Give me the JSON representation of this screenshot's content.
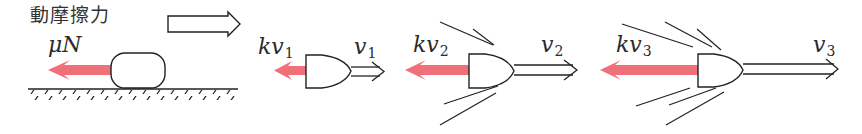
{
  "diagram": {
    "colors": {
      "force_arrow": "#f0707a",
      "stroke": "#222222",
      "background": "#ffffff"
    },
    "panels": [
      {
        "id": "kinetic-friction",
        "title": "動摩擦力",
        "force_label": "μN",
        "object": "block-on-ground",
        "motion_arrow": "hollow-arrow-right"
      },
      {
        "id": "drag-v1",
        "force_label": {
          "base": "kv",
          "sub": "1"
        },
        "velocity_label": {
          "base": "v",
          "sub": "1"
        },
        "object": "bullet",
        "streaks": 0
      },
      {
        "id": "drag-v2",
        "force_label": {
          "base": "kv",
          "sub": "2"
        },
        "velocity_label": {
          "base": "v",
          "sub": "2"
        },
        "object": "bullet",
        "streaks": 4
      },
      {
        "id": "drag-v3",
        "force_label": {
          "base": "kv",
          "sub": "3"
        },
        "velocity_label": {
          "base": "v",
          "sub": "3"
        },
        "object": "bullet",
        "streaks": 6
      }
    ]
  }
}
